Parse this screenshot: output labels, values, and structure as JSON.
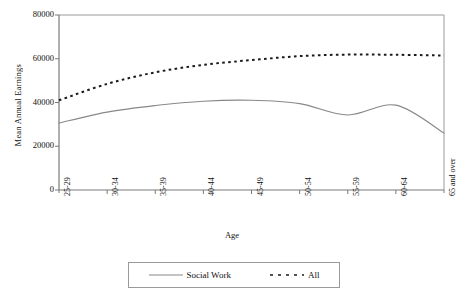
{
  "chart_data": {
    "type": "line",
    "title": "",
    "xlabel": "Age",
    "ylabel": "Mean Annual Earnings",
    "categories": [
      "25-29",
      "30-34",
      "35-39",
      "40-44",
      "45-49",
      "50-54",
      "55-59",
      "60-64",
      "65 and over"
    ],
    "ylim": [
      0,
      80000
    ],
    "yticks": [
      0,
      20000,
      40000,
      60000,
      80000
    ],
    "ytick_labels": [
      "0",
      "20000",
      "40000",
      "60000",
      "80000"
    ],
    "grid": false,
    "legend_position": "bottom",
    "series": [
      {
        "name": "Social Work",
        "style": "solid",
        "color": "#888888",
        "values": [
          30600,
          35600,
          38600,
          40600,
          41000,
          39500,
          34300,
          38800,
          26000
        ]
      },
      {
        "name": "All",
        "style": "dashed",
        "color": "#1a1a1a",
        "values": [
          41000,
          48500,
          53800,
          57200,
          59400,
          61200,
          61900,
          61800,
          61500
        ]
      }
    ]
  },
  "legend": {
    "items": [
      {
        "label": "Social Work"
      },
      {
        "label": "All"
      }
    ]
  }
}
